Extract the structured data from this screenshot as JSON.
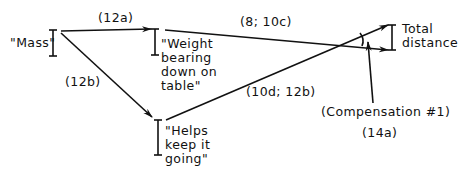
{
  "nodes": {
    "mass": {
      "label": "\"Mass\""
    },
    "weight": {
      "label": "\"Weight\nbearing\ndown on\ntable\""
    },
    "helps": {
      "label": "\"Helps\nkeep it\ngoing\""
    },
    "total": {
      "label": "Total\ndistance"
    }
  },
  "edges": {
    "mass_to_weight": {
      "label": "(12a)"
    },
    "mass_to_helps": {
      "label": "(12b)"
    },
    "weight_to_total": {
      "label": "(8; 10c)"
    },
    "helps_to_total": {
      "label": "(10d; 12b)"
    }
  },
  "compensation": {
    "label": "(Compensation #1)",
    "ref": "(14a)"
  },
  "colors": {
    "ink": "#111111",
    "background": "#ffffff"
  }
}
